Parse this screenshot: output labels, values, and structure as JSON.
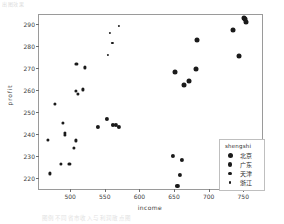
{
  "artifacts": {
    "top_left": "出图效果",
    "bottom_caption": "图例不同省市收入与利润散点图"
  },
  "legend": {
    "title": "shengshi",
    "entries": [
      {
        "label": "北京",
        "size": 5.0,
        "color": "#1a1a1a"
      },
      {
        "label": "广东",
        "size": 4.2,
        "color": "#1a1a1a"
      },
      {
        "label": "天津",
        "size": 3.2,
        "color": "#1a1a1a"
      },
      {
        "label": "浙江",
        "size": 2.2,
        "color": "#1a1a1a"
      }
    ]
  },
  "chart_data": {
    "type": "scatter",
    "title": "",
    "xlabel": "income",
    "ylabel": "profit",
    "xlim": [
      455,
      780
    ],
    "ylim": [
      214,
      294
    ],
    "xticks": [
      500,
      550,
      600,
      650,
      700,
      750
    ],
    "yticks": [
      220,
      230,
      240,
      250,
      260,
      270,
      280,
      290
    ],
    "grid": false,
    "legend_position": "lower-right",
    "legend_title": "shengshi",
    "series": [
      {
        "name": "北京",
        "marker_size": 5.0,
        "color": "#1a1a1a",
        "points": [
          {
            "x": 651,
            "y": 268.0
          },
          {
            "x": 665,
            "y": 262.2
          },
          {
            "x": 672,
            "y": 264.0
          },
          {
            "x": 682,
            "y": 269.5
          },
          {
            "x": 683,
            "y": 282.5
          },
          {
            "x": 735,
            "y": 287.2
          },
          {
            "x": 751,
            "y": 292.5
          },
          {
            "x": 753,
            "y": 292.0
          },
          {
            "x": 754,
            "y": 291.0
          },
          {
            "x": 744,
            "y": 275.5
          }
        ]
      },
      {
        "name": "广东",
        "marker_size": 4.2,
        "color": "#1a1a1a",
        "points": [
          {
            "x": 649,
            "y": 229.8
          },
          {
            "x": 662,
            "y": 228.2
          },
          {
            "x": 658,
            "y": 221.5
          },
          {
            "x": 655,
            "y": 216.2
          },
          {
            "x": 553,
            "y": 246.8
          },
          {
            "x": 540,
            "y": 243.3
          },
          {
            "x": 562,
            "y": 244.0
          },
          {
            "x": 566,
            "y": 243.9
          },
          {
            "x": 570,
            "y": 243.0
          }
        ]
      },
      {
        "name": "天津",
        "marker_size": 3.2,
        "color": "#1a1a1a",
        "points": [
          {
            "x": 478,
            "y": 253.5
          },
          {
            "x": 490,
            "y": 245.0
          },
          {
            "x": 492,
            "y": 240.5
          },
          {
            "x": 493,
            "y": 239.6
          },
          {
            "x": 468,
            "y": 237.2
          },
          {
            "x": 508,
            "y": 237.0
          },
          {
            "x": 505,
            "y": 233.5
          },
          {
            "x": 487,
            "y": 226.2
          },
          {
            "x": 499,
            "y": 226.3
          },
          {
            "x": 471,
            "y": 222.0
          },
          {
            "x": 509,
            "y": 271.8
          },
          {
            "x": 521,
            "y": 270.2
          },
          {
            "x": 508,
            "y": 259.5
          },
          {
            "x": 511,
            "y": 258.0
          },
          {
            "x": 519,
            "y": 260.2
          }
        ]
      },
      {
        "name": "浙江",
        "marker_size": 2.2,
        "color": "#1a1a1a",
        "points": [
          {
            "x": 570,
            "y": 289.0
          },
          {
            "x": 558,
            "y": 285.8
          },
          {
            "x": 561,
            "y": 281.2
          },
          {
            "x": 554,
            "y": 276.0
          }
        ]
      }
    ]
  }
}
